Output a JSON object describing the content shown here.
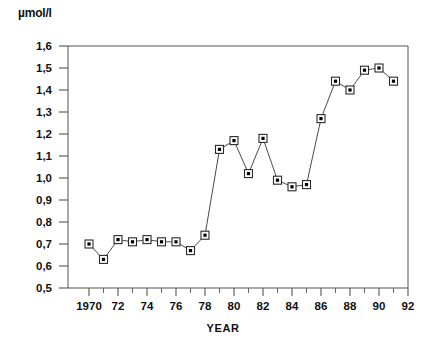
{
  "chart_data": {
    "type": "line",
    "title": "",
    "subtitle": "",
    "xlabel": "YEAR",
    "ylabel": "µmol/l",
    "ylim": [
      0.5,
      1.6
    ],
    "xlim": [
      1969,
      1992
    ],
    "grid": false,
    "legend": null,
    "y_tick_labels": [
      "1,6",
      "1,5",
      "1,4",
      "1,3",
      "1,2",
      "1,1",
      "1,0",
      "0,9",
      "0,8",
      "0,7",
      "0,6",
      "0,5"
    ],
    "y_tick_values": [
      1.6,
      1.5,
      1.4,
      1.3,
      1.2,
      1.1,
      1.0,
      0.9,
      0.8,
      0.7,
      0.6,
      0.5
    ],
    "x_tick_labels": [
      "1970",
      "72",
      "74",
      "76",
      "78",
      "80",
      "82",
      "84",
      "86",
      "88",
      "90",
      "92"
    ],
    "x_tick_values": [
      1970,
      1972,
      1974,
      1976,
      1978,
      1980,
      1982,
      1984,
      1986,
      1988,
      1990,
      1992
    ],
    "x_minor_ticks": [
      1971,
      1973,
      1975,
      1977,
      1979,
      1981,
      1983,
      1985,
      1987,
      1989,
      1991
    ],
    "marker": "square-with-dot",
    "series": [
      {
        "name": "µmol/l",
        "x": [
          1970,
          1971,
          1972,
          1973,
          1974,
          1975,
          1976,
          1977,
          1978,
          1979,
          1980,
          1981,
          1982,
          1983,
          1984,
          1985,
          1986,
          1987,
          1988,
          1989,
          1990,
          1991
        ],
        "values": [
          0.7,
          0.63,
          0.72,
          0.71,
          0.72,
          0.71,
          0.71,
          0.67,
          0.74,
          1.13,
          1.17,
          1.02,
          1.18,
          0.99,
          0.96,
          0.97,
          1.27,
          1.44,
          1.4,
          1.49,
          1.5,
          1.44
        ]
      }
    ],
    "colors": {
      "line": "#4a4a4a",
      "marker_fill": "#000000",
      "marker_border": "#2a2a2a",
      "axis": "#555555",
      "text": "#111111",
      "background": "#ffffff"
    }
  }
}
